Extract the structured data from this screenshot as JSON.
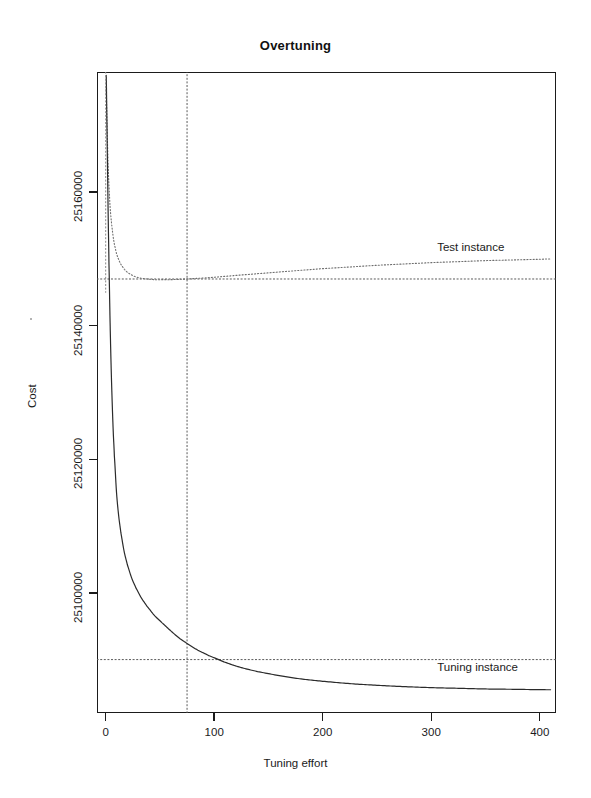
{
  "chart_data": {
    "type": "line",
    "title": "Overtuning",
    "xlabel": "Tuning effort",
    "ylabel": "Cost",
    "xlim": [
      -8,
      415
    ],
    "ylim": [
      25082000,
      25178000
    ],
    "xticks": [
      0,
      100,
      200,
      300,
      400
    ],
    "xticklabels": [
      "0",
      "100",
      "200",
      "300",
      "400"
    ],
    "yticks": [
      25100000,
      25120000,
      25140000,
      25160000
    ],
    "yticklabels": [
      "25100000",
      "25120000",
      "25140000",
      "25160000"
    ],
    "grid": false,
    "legend_position": "inline-annotations",
    "annotations": [
      {
        "text": "Test instance",
        "x": 300,
        "y": 25151500
      },
      {
        "text": "Tuning instance",
        "x": 300,
        "y": 25088600
      }
    ],
    "reference_lines": [
      {
        "orientation": "vertical",
        "value": 75,
        "style": "dotted",
        "label": "optimal tuning effort"
      },
      {
        "orientation": "horizontal",
        "value": 25147000,
        "style": "dotted",
        "label": "test instance cost at optimum"
      },
      {
        "orientation": "horizontal",
        "value": 25090000,
        "style": "dotted",
        "label": "tuning instance cost at optimum"
      }
    ],
    "series": [
      {
        "name": "Test instance",
        "style": "dotted",
        "color": "#6e6e6e",
        "x": [
          0.5,
          1,
          1.5,
          2,
          2.5,
          3,
          4,
          5,
          6,
          7,
          8,
          10,
          12,
          14,
          17,
          20,
          24,
          28,
          33,
          38,
          45,
          52,
          60,
          68,
          75,
          85,
          95,
          110,
          125,
          140,
          160,
          180,
          200,
          225,
          250,
          275,
          300,
          325,
          350,
          375,
          400,
          410
        ],
        "y": [
          25175500,
          25172000,
          25168500,
          25165500,
          25163000,
          25161000,
          25158000,
          25156000,
          25154500,
          25153200,
          25152200,
          25150800,
          25149900,
          25149200,
          25148500,
          25148000,
          25147600,
          25147300,
          25147100,
          25147000,
          25146900,
          25146900,
          25146900,
          25146950,
          25147000,
          25147100,
          25147200,
          25147400,
          25147600,
          25147800,
          25148050,
          25148300,
          25148550,
          25148800,
          25149050,
          25149250,
          25149450,
          25149600,
          25149750,
          25149850,
          25149950,
          25150000
        ]
      },
      {
        "name": "Tuning instance",
        "style": "solid",
        "color": "#2b2b2b",
        "x": [
          0.5,
          1,
          1.5,
          2,
          2.5,
          3,
          4,
          5,
          6,
          7,
          8,
          10,
          12,
          14,
          17,
          20,
          24,
          28,
          33,
          38,
          45,
          52,
          60,
          68,
          75,
          85,
          95,
          110,
          125,
          140,
          160,
          180,
          200,
          225,
          250,
          275,
          300,
          325,
          350,
          375,
          400,
          410
        ],
        "y": [
          25177500,
          25172000,
          25166000,
          25160000,
          25154500,
          25149500,
          25141000,
          25134000,
          25128500,
          25124000,
          25120500,
          25115000,
          25111500,
          25109000,
          25106200,
          25104200,
          25102200,
          25100700,
          25099200,
          25098000,
          25096600,
          25095500,
          25094300,
          25093200,
          25092400,
          25091400,
          25090600,
          25089600,
          25088800,
          25088200,
          25087600,
          25087100,
          25086750,
          25086400,
          25086150,
          25085950,
          25085800,
          25085700,
          25085600,
          25085550,
          25085500,
          25085480
        ]
      }
    ]
  }
}
